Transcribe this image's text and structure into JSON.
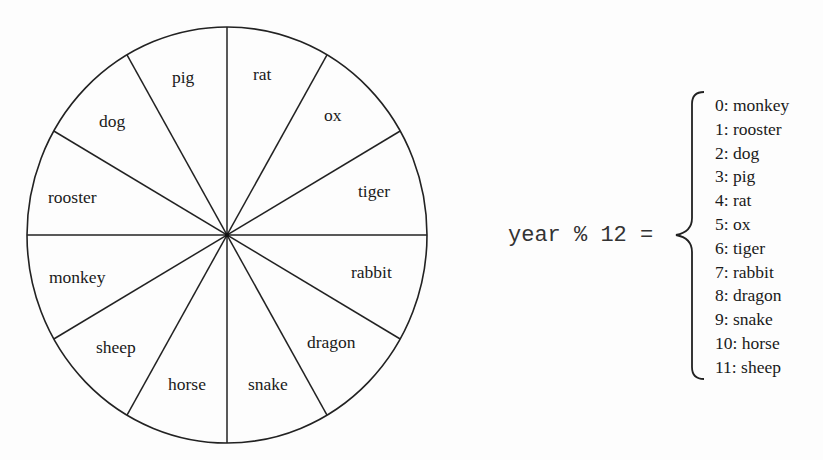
{
  "wheel": {
    "center": [
      227,
      235
    ],
    "radius_x": 200,
    "radius_y": 208,
    "stroke_color": "#222222",
    "segments": [
      {
        "label": "rat",
        "x": 253,
        "y": 80
      },
      {
        "label": "ox",
        "x": 324,
        "y": 121
      },
      {
        "label": "tiger",
        "x": 358,
        "y": 197
      },
      {
        "label": "rabbit",
        "x": 351,
        "y": 278
      },
      {
        "label": "dragon",
        "x": 307,
        "y": 348
      },
      {
        "label": "snake",
        "x": 248,
        "y": 390
      },
      {
        "label": "horse",
        "x": 168,
        "y": 390
      },
      {
        "label": "sheep",
        "x": 96,
        "y": 353
      },
      {
        "label": "monkey",
        "x": 49,
        "y": 283
      },
      {
        "label": "rooster",
        "x": 48,
        "y": 203
      },
      {
        "label": "dog",
        "x": 99,
        "y": 127
      },
      {
        "label": "pig",
        "x": 172,
        "y": 83
      }
    ]
  },
  "formula": {
    "text": "year % 12 =",
    "x": 508,
    "y": 241
  },
  "mapping": {
    "items": [
      {
        "index": "0",
        "animal": "monkey",
        "text": "0: monkey"
      },
      {
        "index": "1",
        "animal": "rooster",
        "text": "1: rooster"
      },
      {
        "index": "2",
        "animal": "dog",
        "text": "2: dog"
      },
      {
        "index": "3",
        "animal": "pig",
        "text": "3: pig"
      },
      {
        "index": "4",
        "animal": "rat",
        "text": "4: rat"
      },
      {
        "index": "5",
        "animal": "ox",
        "text": "5: ox"
      },
      {
        "index": "6",
        "animal": "tiger",
        "text": "6: tiger"
      },
      {
        "index": "7",
        "animal": "rabbit",
        "text": "7: rabbit"
      },
      {
        "index": "8",
        "animal": "dragon",
        "text": "8: dragon"
      },
      {
        "index": "9",
        "animal": "snake",
        "text": "9: snake"
      },
      {
        "index": "10",
        "animal": "horse",
        "text": "10: horse"
      },
      {
        "index": "11",
        "animal": "sheep",
        "text": "11: sheep"
      }
    ],
    "x": 715,
    "first_baseline": 111,
    "line_height": 23.8
  }
}
